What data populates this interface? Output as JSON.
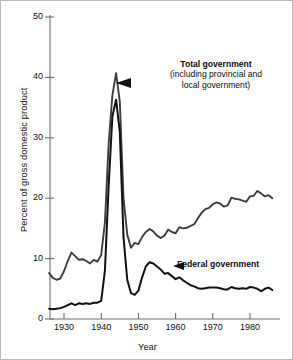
{
  "chart_data": {
    "type": "line",
    "title": "",
    "xlabel": "Year",
    "ylabel": "Percent of gross domestic product",
    "xlim": [
      1925,
      1987
    ],
    "ylim": [
      0,
      52
    ],
    "grid": false,
    "legend_position": "inline-annotations",
    "xticks": [
      1930,
      1940,
      1950,
      1960,
      1970,
      1980
    ],
    "xtick_labels": [
      "1930",
      "1940",
      "1950",
      "1960",
      "1970",
      "1980"
    ],
    "yticks": [
      0,
      10,
      20,
      30,
      40,
      50
    ],
    "ytick_labels": [
      "0",
      "10",
      "20",
      "30",
      "40",
      "50"
    ],
    "annotations": [
      {
        "name": "total-government",
        "title": "Total government",
        "subtitle_line1": "(including provincial and",
        "subtitle_line2": "local government)",
        "points_to_year": 1944,
        "points_to_value": 39.0
      },
      {
        "name": "federal-government",
        "title": "Federal government",
        "points_to_year": 1956,
        "points_to_value": 7.6
      }
    ],
    "series": [
      {
        "name": "Total government (including provincial and local government)",
        "color": "#3d3d3d",
        "x": [
          1926,
          1927,
          1928,
          1929,
          1930,
          1931,
          1932,
          1933,
          1934,
          1935,
          1936,
          1937,
          1938,
          1939,
          1940,
          1941,
          1942,
          1943,
          1944,
          1945,
          1946,
          1947,
          1948,
          1949,
          1950,
          1951,
          1952,
          1953,
          1954,
          1955,
          1956,
          1957,
          1958,
          1959,
          1960,
          1961,
          1962,
          1963,
          1964,
          1965,
          1966,
          1967,
          1968,
          1969,
          1970,
          1971,
          1972,
          1973,
          1974,
          1975,
          1976,
          1977,
          1978,
          1979,
          1980,
          1981,
          1982,
          1983,
          1984,
          1985,
          1986
        ],
        "y": [
          7.6,
          6.8,
          6.5,
          6.7,
          7.9,
          9.6,
          11.0,
          10.4,
          9.8,
          9.9,
          9.6,
          9.2,
          9.8,
          9.5,
          10.6,
          16.0,
          29.0,
          37.0,
          40.7,
          36.0,
          20.0,
          14.0,
          11.8,
          12.6,
          12.4,
          13.6,
          14.4,
          14.9,
          14.5,
          13.8,
          13.4,
          13.8,
          14.8,
          14.4,
          14.2,
          15.2,
          15.0,
          15.1,
          15.4,
          15.7,
          16.7,
          17.6,
          18.2,
          18.4,
          19.0,
          19.3,
          19.1,
          18.6,
          18.8,
          20.1,
          19.9,
          19.8,
          19.6,
          19.4,
          20.3,
          20.4,
          21.2,
          20.8,
          20.3,
          20.5,
          20.0
        ]
      },
      {
        "name": "Federal government",
        "color": "#111111",
        "x": [
          1926,
          1927,
          1928,
          1929,
          1930,
          1931,
          1932,
          1933,
          1934,
          1935,
          1936,
          1937,
          1938,
          1939,
          1940,
          1941,
          1942,
          1943,
          1944,
          1945,
          1946,
          1947,
          1948,
          1949,
          1950,
          1951,
          1952,
          1953,
          1954,
          1955,
          1956,
          1957,
          1958,
          1959,
          1960,
          1961,
          1962,
          1963,
          1964,
          1965,
          1966,
          1967,
          1968,
          1969,
          1970,
          1971,
          1972,
          1973,
          1974,
          1975,
          1976,
          1977,
          1978,
          1979,
          1980,
          1981,
          1982,
          1983,
          1984,
          1985,
          1986
        ],
        "y": [
          1.7,
          1.6,
          1.7,
          1.8,
          2.0,
          2.3,
          2.6,
          2.3,
          2.6,
          2.5,
          2.6,
          2.5,
          2.7,
          2.7,
          3.0,
          8.0,
          22.0,
          33.5,
          36.3,
          31.0,
          13.5,
          6.5,
          4.3,
          4.0,
          4.7,
          6.9,
          8.7,
          9.4,
          9.2,
          8.7,
          8.2,
          7.5,
          7.6,
          7.1,
          6.6,
          6.9,
          6.4,
          6.0,
          5.6,
          5.4,
          5.1,
          5.0,
          5.1,
          5.2,
          5.2,
          5.2,
          5.1,
          4.9,
          4.9,
          5.3,
          5.1,
          5.0,
          5.1,
          5.0,
          5.3,
          5.2,
          5.0,
          4.6,
          5.0,
          5.2,
          4.8
        ]
      }
    ]
  },
  "figure": {
    "ylabel": "Percent of gross domestic product",
    "xlabel": "Year"
  }
}
